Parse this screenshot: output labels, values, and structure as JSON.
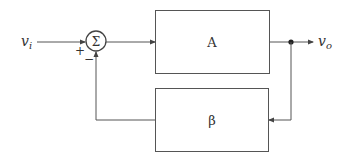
{
  "diagram": {
    "type": "feedback-block-diagram",
    "input_label": "v",
    "input_sub": "i",
    "output_label": "v",
    "output_sub": "o",
    "summer_symbol": "Σ",
    "plus_sign": "+",
    "minus_sign": "−",
    "forward_block": "A",
    "feedback_block": "β",
    "line_color": "#555555"
  }
}
